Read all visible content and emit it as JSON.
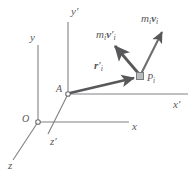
{
  "figure": {
    "background_color": "#ffffff",
    "line_color": "#808183",
    "vector_color": "#58585a",
    "label_color": "#58585a",
    "width": 196,
    "height": 177
  },
  "axes": [
    {
      "id": "y",
      "label": "y",
      "prime": false,
      "x": 30,
      "y": 34,
      "kind": "axis-label"
    },
    {
      "id": "y-prime",
      "label": "y",
      "prime": true,
      "x": 72,
      "y": 8,
      "kind": "axis-label"
    },
    {
      "id": "x",
      "label": "x",
      "prime": false,
      "x": 133,
      "y": 122,
      "kind": "axis-label"
    },
    {
      "id": "x-prime",
      "label": "x",
      "prime": true,
      "x": 174,
      "y": 100,
      "kind": "axis-label"
    },
    {
      "id": "z",
      "label": "z",
      "prime": false,
      "x": 9,
      "y": 162,
      "kind": "axis-label"
    },
    {
      "id": "z-prime",
      "label": "z",
      "prime": true,
      "x": 51,
      "y": 138,
      "kind": "axis-label"
    }
  ],
  "points": [
    {
      "id": "origin-O",
      "label": "O",
      "x": 22,
      "y": 114,
      "marker": "open-circle"
    },
    {
      "id": "point-A",
      "label": "A",
      "x": 56,
      "y": 86,
      "marker": "open-circle"
    },
    {
      "id": "point-Pi",
      "label": "P",
      "sub": "i",
      "x": 147,
      "y": 74,
      "marker": "square"
    }
  ],
  "vectors": [
    {
      "id": "r-prime-i",
      "label_m": "",
      "label_v": "r",
      "prime": true,
      "sub": "i",
      "lx": 94,
      "ly": 62,
      "from": "A",
      "to": "Pi"
    },
    {
      "id": "mi-v-prime-i",
      "label_m": "m",
      "label_v": "v",
      "prime": true,
      "sub": "i",
      "lx": 96,
      "ly": 30,
      "from": "Pi",
      "to": "upper-left"
    },
    {
      "id": "mi-vi",
      "label_m": "m",
      "label_v": "v",
      "prime": false,
      "sub": "i",
      "lx": 142,
      "ly": 14,
      "from": "Pi",
      "to": "upper-right"
    }
  ],
  "geometry": {
    "origin": {
      "x": 38,
      "y": 122
    },
    "A": {
      "x": 68,
      "y": 94
    },
    "Pi": {
      "x": 140,
      "y": 76
    },
    "y_axis_top": {
      "x": 38,
      "y": 45
    },
    "x_axis_end": {
      "x": 129,
      "y": 122
    },
    "z_axis_end": {
      "x": 13,
      "y": 160
    },
    "yprime_axis_top": {
      "x": 68,
      "y": 22
    },
    "xprime_axis_end": {
      "x": 188,
      "y": 94
    },
    "zprime_axis_end": {
      "x": 48,
      "y": 134
    },
    "mivprime_tip": {
      "x": 113,
      "y": 45
    },
    "mivi_tip": {
      "x": 163,
      "y": 30
    }
  }
}
